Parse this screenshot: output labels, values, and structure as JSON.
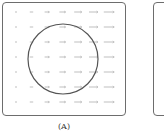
{
  "figure": {
    "panels": [
      {
        "id": "A",
        "label": "(A)",
        "field": {
          "rows": 7,
          "cols": 7,
          "description": "uniform horizontal vector field pointing right, arrows grow longer toward the right",
          "arrow_color": "#b8b8b8"
        },
        "circle": {
          "cx": 63,
          "cy": 59,
          "r": 35,
          "stroke": "#555555"
        }
      },
      {
        "id": "B",
        "label": "",
        "partially_visible": true
      }
    ]
  }
}
